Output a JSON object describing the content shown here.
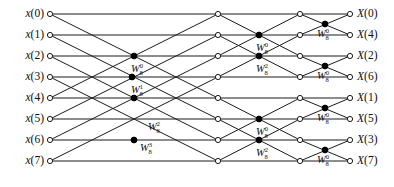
{
  "figure": {
    "type": "signal-flow-graph",
    "stages": 3,
    "points": 8
  },
  "inputs": [
    {
      "id": "in-0",
      "label": "x(0)",
      "row": 0,
      "y": 14
    },
    {
      "id": "in-1",
      "label": "x(1)",
      "row": 1,
      "y": 35
    },
    {
      "id": "in-2",
      "label": "x(2)",
      "row": 2,
      "y": 56
    },
    {
      "id": "in-3",
      "label": "x(3)",
      "row": 3,
      "y": 77
    },
    {
      "id": "in-4",
      "label": "x(4)",
      "row": 4,
      "y": 98
    },
    {
      "id": "in-5",
      "label": "x(5)",
      "row": 5,
      "y": 119
    },
    {
      "id": "in-6",
      "label": "x(6)",
      "row": 6,
      "y": 140
    },
    {
      "id": "in-7",
      "label": "x(7)",
      "row": 7,
      "y": 161
    }
  ],
  "outputs": [
    {
      "id": "out-0",
      "label": "X(0)",
      "row": 0,
      "y": 14
    },
    {
      "id": "out-1",
      "label": "X(4)",
      "row": 1,
      "y": 35
    },
    {
      "id": "out-2",
      "label": "X(2)",
      "row": 2,
      "y": 56
    },
    {
      "id": "out-3",
      "label": "X(6)",
      "row": 3,
      "y": 77
    },
    {
      "id": "out-4",
      "label": "X(1)",
      "row": 4,
      "y": 98
    },
    {
      "id": "out-5",
      "label": "X(5)",
      "row": 5,
      "y": 119
    },
    {
      "id": "out-6",
      "label": "X(3)",
      "row": 6,
      "y": 140
    },
    {
      "id": "out-7",
      "label": "X(7)",
      "row": 7,
      "y": 161
    }
  ],
  "twiddles": [
    {
      "id": "tw-s1-0",
      "base": "W",
      "sub": "8",
      "sup": "0",
      "x": 131,
      "y": 69,
      "stage": 1
    },
    {
      "id": "tw-s1-1",
      "base": "W",
      "sub": "8",
      "sup": "1",
      "x": 131,
      "y": 90,
      "stage": 1
    },
    {
      "id": "tw-s1-2",
      "base": "W",
      "sub": "8",
      "sup": "2",
      "x": 148,
      "y": 127,
      "stage": 1
    },
    {
      "id": "tw-s1-3",
      "base": "W",
      "sub": "8",
      "sup": "3",
      "x": 140,
      "y": 148,
      "stage": 1
    },
    {
      "id": "tw-s2-0",
      "base": "W",
      "sub": "8",
      "sup": "0",
      "x": 256,
      "y": 48,
      "stage": 2
    },
    {
      "id": "tw-s2-1",
      "base": "W",
      "sub": "8",
      "sup": "2",
      "x": 256,
      "y": 69,
      "stage": 2
    },
    {
      "id": "tw-s2-2",
      "base": "W",
      "sub": "8",
      "sup": "0",
      "x": 256,
      "y": 132,
      "stage": 2
    },
    {
      "id": "tw-s2-3",
      "base": "W",
      "sub": "8",
      "sup": "2",
      "x": 256,
      "y": 153,
      "stage": 2
    },
    {
      "id": "tw-s3-0",
      "base": "W",
      "sub": "8",
      "sup": "0",
      "x": 317,
      "y": 34,
      "stage": 3
    },
    {
      "id": "tw-s3-1",
      "base": "W",
      "sub": "8",
      "sup": "0",
      "x": 317,
      "y": 76,
      "stage": 3
    },
    {
      "id": "tw-s3-2",
      "base": "W",
      "sub": "8",
      "sup": "0",
      "x": 317,
      "y": 118,
      "stage": 3
    },
    {
      "id": "tw-s3-3",
      "base": "W",
      "sub": "8",
      "sup": "0",
      "x": 317,
      "y": 160,
      "stage": 3
    }
  ],
  "columns": {
    "input_x": 50,
    "stage1_out_x": 218,
    "stage2_out_x": 300,
    "output_x": 350
  },
  "nodes": {
    "open_radius": 2.6,
    "solid_radius": 2.9,
    "open_columns": [
      50,
      218,
      300,
      350
    ],
    "solid_points": [
      {
        "x": 134,
        "y": 56
      },
      {
        "x": 134,
        "y": 98
      },
      {
        "x": 134,
        "y": 140
      },
      {
        "x": 132,
        "y": 77
      },
      {
        "x": 259,
        "y": 35
      },
      {
        "x": 259,
        "y": 56
      },
      {
        "x": 259,
        "y": 119
      },
      {
        "x": 259,
        "y": 140
      },
      {
        "x": 325,
        "y": 24
      },
      {
        "x": 325,
        "y": 66
      },
      {
        "x": 325,
        "y": 108
      },
      {
        "x": 325,
        "y": 150
      }
    ]
  },
  "colors": {
    "line": "#1a1a1a",
    "node_fill_open": "#ffffff",
    "node_fill_solid": "#000000",
    "text": "#0d0d0d",
    "background": "#ffffff"
  },
  "edges_stage1": [
    {
      "from_row": 0,
      "to_row": 0
    },
    {
      "from_row": 0,
      "to_row": 4
    },
    {
      "from_row": 4,
      "to_row": 0
    },
    {
      "from_row": 4,
      "to_row": 4
    },
    {
      "from_row": 1,
      "to_row": 1
    },
    {
      "from_row": 1,
      "to_row": 5
    },
    {
      "from_row": 5,
      "to_row": 1
    },
    {
      "from_row": 5,
      "to_row": 5
    },
    {
      "from_row": 2,
      "to_row": 2
    },
    {
      "from_row": 2,
      "to_row": 6
    },
    {
      "from_row": 6,
      "to_row": 2
    },
    {
      "from_row": 6,
      "to_row": 6
    },
    {
      "from_row": 3,
      "to_row": 3
    },
    {
      "from_row": 3,
      "to_row": 7
    },
    {
      "from_row": 7,
      "to_row": 3
    },
    {
      "from_row": 7,
      "to_row": 7
    }
  ],
  "edges_stage2": [
    {
      "from_row": 0,
      "to_row": 0
    },
    {
      "from_row": 0,
      "to_row": 2
    },
    {
      "from_row": 2,
      "to_row": 0
    },
    {
      "from_row": 2,
      "to_row": 2
    },
    {
      "from_row": 1,
      "to_row": 1
    },
    {
      "from_row": 1,
      "to_row": 3
    },
    {
      "from_row": 3,
      "to_row": 1
    },
    {
      "from_row": 3,
      "to_row": 3
    },
    {
      "from_row": 4,
      "to_row": 4
    },
    {
      "from_row": 4,
      "to_row": 6
    },
    {
      "from_row": 6,
      "to_row": 4
    },
    {
      "from_row": 6,
      "to_row": 6
    },
    {
      "from_row": 5,
      "to_row": 5
    },
    {
      "from_row": 5,
      "to_row": 7
    },
    {
      "from_row": 7,
      "to_row": 5
    },
    {
      "from_row": 7,
      "to_row": 7
    }
  ],
  "edges_stage3": [
    {
      "from_row": 0,
      "to_row": 0
    },
    {
      "from_row": 0,
      "to_row": 1
    },
    {
      "from_row": 1,
      "to_row": 0
    },
    {
      "from_row": 1,
      "to_row": 1
    },
    {
      "from_row": 2,
      "to_row": 2
    },
    {
      "from_row": 2,
      "to_row": 3
    },
    {
      "from_row": 3,
      "to_row": 2
    },
    {
      "from_row": 3,
      "to_row": 3
    },
    {
      "from_row": 4,
      "to_row": 4
    },
    {
      "from_row": 4,
      "to_row": 5
    },
    {
      "from_row": 5,
      "to_row": 4
    },
    {
      "from_row": 5,
      "to_row": 5
    },
    {
      "from_row": 6,
      "to_row": 6
    },
    {
      "from_row": 6,
      "to_row": 7
    },
    {
      "from_row": 7,
      "to_row": 6
    },
    {
      "from_row": 7,
      "to_row": 7
    }
  ]
}
